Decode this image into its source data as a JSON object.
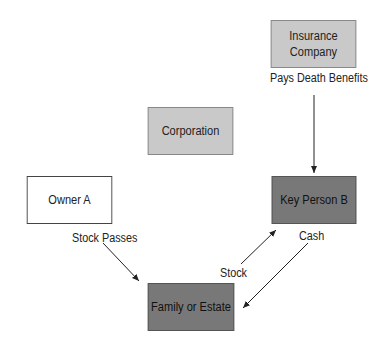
{
  "diagram": {
    "nodes": [
      {
        "id": "insurance",
        "label": "Insurance\nCompany",
        "label_line1": "Insurance",
        "label_line2": "Company",
        "fill": "#c9c9c9"
      },
      {
        "id": "corporation",
        "label": "Corporation",
        "fill": "#c9c9c9"
      },
      {
        "id": "owner_a",
        "label": "Owner A",
        "fill": "#ffffff"
      },
      {
        "id": "key_person_b",
        "label": "Key Person B",
        "fill": "#787878"
      },
      {
        "id": "family_estate",
        "label": "Family or Estate",
        "fill": "#787878"
      }
    ],
    "edges": [
      {
        "from": "insurance",
        "to": "key_person_b",
        "label": "Pays Death Benefits"
      },
      {
        "from": "owner_a",
        "to": "family_estate",
        "label": "Stock Passes"
      },
      {
        "from": "family_estate",
        "to": "key_person_b",
        "label": "Stock"
      },
      {
        "from": "key_person_b",
        "to": "family_estate",
        "label": "Cash"
      }
    ]
  }
}
